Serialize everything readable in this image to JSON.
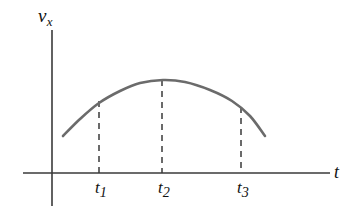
{
  "figure": {
    "background_color": "#ffffff",
    "width": 359,
    "height": 206,
    "axis_color": "#3a3a3a",
    "curve_color": "#6b6b6b",
    "text_color": "#111111"
  },
  "labels": {
    "y_axis": "v",
    "y_axis_subscript": "x",
    "x_axis": "t",
    "tick_1": "t",
    "tick_1_subscript": "1",
    "tick_2": "t",
    "tick_2_subscript": "2",
    "tick_3": "t",
    "tick_3_subscript": "3"
  },
  "chart_data": {
    "type": "line",
    "title": "",
    "xlabel": "t",
    "ylabel": "v_x",
    "grid": false,
    "legend": null,
    "xlim": [
      0,
      1
    ],
    "ylim": [
      0,
      1
    ],
    "axes": {
      "y_axis_x_px": 52,
      "x_axis_y_px": 173,
      "x_axis_start_px": 23,
      "x_axis_end_px": 330,
      "y_axis_top_px": 30,
      "y_axis_bottom_px": 206
    },
    "series": [
      {
        "name": "v_x(t)",
        "description": "Smooth concave-down parabolic velocity curve rising to a maximum at t2 then falling",
        "points_px": [
          [
            63,
            136
          ],
          [
            80,
            119
          ],
          [
            99,
            103
          ],
          [
            120,
            91
          ],
          [
            140,
            83
          ],
          [
            163,
            80
          ],
          [
            185,
            82
          ],
          [
            210,
            90
          ],
          [
            232,
            101
          ],
          [
            250,
            116
          ],
          [
            265,
            136
          ]
        ]
      }
    ],
    "annotations": [
      {
        "label": "t1",
        "type": "dashed-vertical",
        "x_px": 99,
        "y_top_px": 101,
        "y_bottom_px": 173,
        "meaning": "time before maximum, curve rising"
      },
      {
        "label": "t2",
        "type": "dashed-vertical",
        "x_px": 162,
        "y_top_px": 80,
        "y_bottom_px": 173,
        "meaning": "time of maximum velocity, curve apex"
      },
      {
        "label": "t3",
        "type": "dashed-vertical",
        "x_px": 241,
        "y_top_px": 107,
        "y_bottom_px": 173,
        "meaning": "time after maximum, curve falling"
      }
    ],
    "tick_labels_px": [
      {
        "text": "t1",
        "x": 101,
        "y": 188
      },
      {
        "text": "t2",
        "x": 164,
        "y": 188
      },
      {
        "text": "t3",
        "x": 243,
        "y": 188
      }
    ]
  }
}
